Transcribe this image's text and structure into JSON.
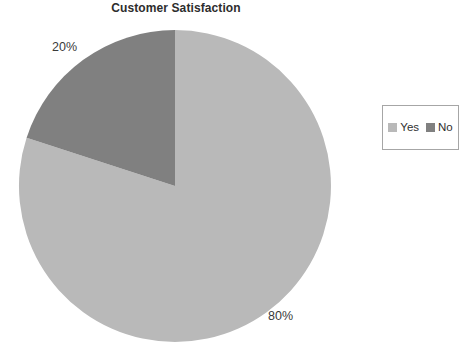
{
  "chart_data": {
    "type": "pie",
    "title": "Customer Satisfaction",
    "categories": [
      "Yes",
      "No"
    ],
    "values": [
      80,
      20
    ],
    "labels": [
      "80%",
      "20%"
    ],
    "colors": [
      "#b9b9b9",
      "#808080"
    ],
    "legend": {
      "position": "right",
      "entries": [
        {
          "label": "Yes",
          "color": "#b9b9b9"
        },
        {
          "label": "No",
          "color": "#808080"
        }
      ]
    },
    "start_angle_deg": 0,
    "direction": "clockwise",
    "grid": false,
    "xlabel": "",
    "ylabel": ""
  },
  "geometry": {
    "center_x": 175,
    "center_y": 186,
    "radius": 156
  },
  "slices": [
    {
      "name": "Yes",
      "value": 80,
      "label": "80%",
      "color": "#b9b9b9",
      "path": "M 175 186 L 175 30 A 156 156 0 1 1 26.6 137.8 Z"
    },
    {
      "name": "No",
      "value": 20,
      "label": "20%",
      "color": "#808080",
      "path": "M 175 186 L 26.6 137.8 A 156 156 0 0 1 175 30 Z"
    }
  ]
}
